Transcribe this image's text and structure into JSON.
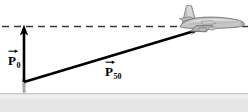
{
  "figure": {
    "background_color": "#ffffff",
    "width": 248,
    "height": 112
  },
  "ground": {
    "name": "ground-surface",
    "color": "#e3e3e3",
    "edge_color": "#c9c9c9"
  },
  "reference_line": {
    "name": "horizontal-dashed-reference-line",
    "style": "dashed",
    "color": "#2b2b2b"
  },
  "vectors": [
    {
      "id": "p0",
      "label_base": "P",
      "label_sub": "0",
      "description": "initial momentum vector, vertical, pointing up",
      "color": "#000000",
      "x1": 24,
      "y1": 82,
      "x2": 24,
      "y2": 27
    },
    {
      "id": "p50",
      "label_base": "P",
      "label_sub": "50",
      "description": "momentum vector after 50 seconds, pointing up and to the right",
      "color": "#000000",
      "x1": 24,
      "y1": 82,
      "x2": 203,
      "y2": 28
    }
  ],
  "airplane": {
    "name": "airplane",
    "description": "side view of a commercial jet airliner, nose pointing right",
    "body_color": "#b7b7b7",
    "outline_color": "#6f6f6f",
    "highlight_color": "#dcdcdc"
  },
  "person": {
    "name": "observer-figure",
    "description": "small standing observer at the vector origin on the ground",
    "color": "#9a9a9a"
  }
}
